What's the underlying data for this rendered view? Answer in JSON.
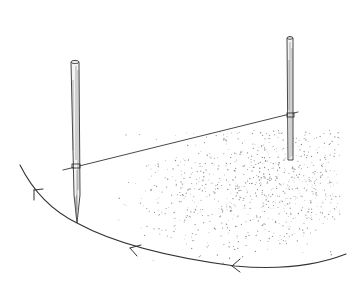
{
  "illustration": {
    "subject": "two stakes joined by a taut string scribing a circular arc on stippled ground",
    "background_color": "#ffffff",
    "ink_color": "#333333",
    "stipple_color": "#8a8a8a",
    "left_stake": {
      "top": [
        75,
        60
      ],
      "tie_y": 165,
      "tip": [
        77,
        223
      ],
      "width": 8
    },
    "right_stake": {
      "top": [
        290,
        36
      ],
      "tie_y": 115,
      "base_y": 160,
      "width": 6
    },
    "string": {
      "from": [
        63,
        170
      ],
      "to": [
        298,
        112
      ]
    },
    "arc": {
      "path": "M20,165 Q40,205 77,223 Q130,252 235,266 Q300,272 346,254"
    },
    "arrows": [
      {
        "at": [
          36,
          190
        ],
        "direction": "up-left"
      },
      {
        "at": [
          133,
          249
        ],
        "direction": "left"
      },
      {
        "at": [
          235,
          266
        ],
        "direction": "left"
      }
    ]
  }
}
